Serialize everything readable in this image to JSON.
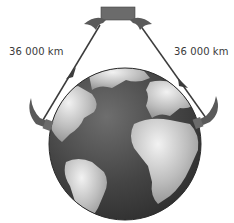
{
  "diagram": {
    "labels": {
      "uplink_distance": "36 000 km",
      "downlink_distance": "36 000 km"
    },
    "elements": {
      "satellite": "satellite with two dish antennas",
      "earth": "globe showing Atlantic Ocean, Americas, Europe and Africa",
      "left_station": "ground station dish (transmitting)",
      "right_station": "ground station dish (receiving)"
    },
    "colors": {
      "satellite_body": "#6b6b6b",
      "dish": "#5a5a5a",
      "arrow": "#3c3c3c",
      "ocean": "#4a4a4a",
      "land": "#b9b9b9",
      "text": "#3a3a3a"
    }
  }
}
